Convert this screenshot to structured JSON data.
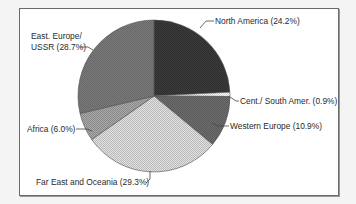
{
  "chart_data": {
    "type": "pie",
    "title": "",
    "start_angle_deg": 0,
    "direction": "clockwise",
    "categories": [
      "North America",
      "Cent./ South Amer.",
      "Western Europe",
      "Far East and Oceania",
      "Africa",
      "East. Europe/ USSR"
    ],
    "values": [
      24.2,
      0.9,
      10.9,
      29.3,
      6.0,
      28.7
    ],
    "unit": "%",
    "colors": [
      "#3a3a3a",
      "#ffffff",
      "#6e6e6e",
      "#e2e2e2",
      "#a8a8a8",
      "#7c7c7c"
    ],
    "legend": "none",
    "labels": [
      "North America (24.2%)",
      "Cent./ South Amer. (0.9%)",
      "Western Europe (10.9%)",
      "Far East and Oceania (29.3%)",
      "Africa (6.0%)",
      "East. Europe/",
      "USSR (28.7%)"
    ]
  },
  "labels": {
    "north_america": "North America (24.2%)",
    "cent_south_amer": "Cent./ South Amer. (0.9%)",
    "western_europe": "Western Europe (10.9%)",
    "far_east": "Far East and Oceania (29.3%)",
    "africa": "Africa (6.0%)",
    "east_europe_line1": "East. Europe/",
    "east_europe_line2": "USSR (28.7%)"
  }
}
